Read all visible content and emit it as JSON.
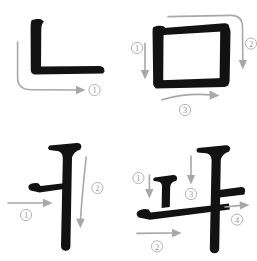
{
  "page": {
    "title": "Hangul stroke order chart",
    "background_color": "#ffffff",
    "glyph_color": "#121212",
    "arrow_color": "#a8a8a8",
    "order_label_color": "#9a9a9a"
  },
  "cells": [
    {
      "id": "nieun",
      "glyph": "ㄴ",
      "romanization": "n",
      "name": "nieun",
      "stroke_count": 1,
      "strokes": [
        {
          "order": 1,
          "label": "①",
          "direction": "down-then-right"
        }
      ]
    },
    {
      "id": "mieum",
      "glyph": "ㅁ",
      "romanization": "m",
      "name": "mieum",
      "stroke_count": 3,
      "strokes": [
        {
          "order": 1,
          "label": "①",
          "direction": "down"
        },
        {
          "order": 2,
          "label": "②",
          "direction": "right-then-down"
        },
        {
          "order": 3,
          "label": "③",
          "direction": "right"
        }
      ]
    },
    {
      "id": "eo",
      "glyph": "ㅓ",
      "romanization": "eo",
      "name": "eo",
      "stroke_count": 2,
      "strokes": [
        {
          "order": 1,
          "label": "①",
          "direction": "right"
        },
        {
          "order": 2,
          "label": "②",
          "direction": "down"
        }
      ]
    },
    {
      "id": "wa",
      "glyph": "ㅘ",
      "romanization": "wa",
      "name": "wa",
      "stroke_count": 4,
      "strokes": [
        {
          "order": 1,
          "label": "①",
          "direction": "down"
        },
        {
          "order": 2,
          "label": "②",
          "direction": "right"
        },
        {
          "order": 3,
          "label": "③",
          "direction": "down"
        },
        {
          "order": 4,
          "label": "④",
          "direction": "right"
        }
      ]
    }
  ]
}
